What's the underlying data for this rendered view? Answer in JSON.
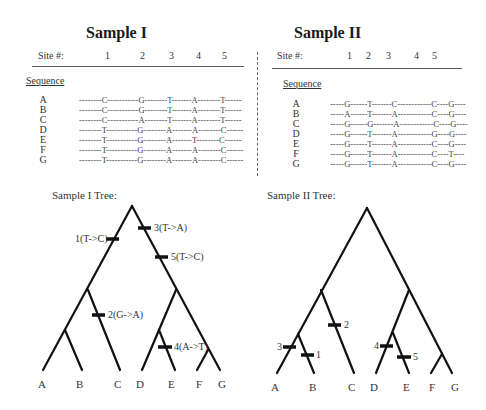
{
  "panels": [
    {
      "title": "Sample I",
      "site_label": "Site #:",
      "sites": [
        "1",
        "2",
        "3",
        "4",
        "5"
      ],
      "sequence_label": "Sequence",
      "rows": [
        {
          "taxon": "A",
          "bases": [
            "C",
            "G",
            "T",
            "A",
            "T"
          ],
          "display": "--------C-----------G--------T-------A--------T------"
        },
        {
          "taxon": "B",
          "bases": [
            "C",
            "G",
            "T",
            "A",
            "T"
          ],
          "display": "--------C-----------G--------T-------A--------T------"
        },
        {
          "taxon": "C",
          "bases": [
            "C",
            "A",
            "T",
            "A",
            "T"
          ],
          "display": "--------C-----------A--------T-------A--------T------"
        },
        {
          "taxon": "D",
          "bases": [
            "T",
            "G",
            "A",
            "A",
            "C"
          ],
          "display": "--------T-----------G--------A-------A--------C------"
        },
        {
          "taxon": "E",
          "bases": [
            "T",
            "G",
            "A",
            "T",
            "C"
          ],
          "display": "--------T-----------G--------A-------T--------C------"
        },
        {
          "taxon": "F",
          "bases": [
            "T",
            "G",
            "A",
            "A",
            "C"
          ],
          "display": "--------T-----------G--------A-------A--------C------"
        },
        {
          "taxon": "G",
          "bases": [
            "T",
            "G",
            "A",
            "A",
            "C"
          ],
          "display": "--------T-----------G--------A-------A--------C------"
        }
      ],
      "tree_title": "Sample I Tree:",
      "tree_leaves": [
        "A",
        "B",
        "C",
        "D",
        "E",
        "F",
        "G"
      ],
      "mutations": [
        {
          "label": "1(T->C)"
        },
        {
          "label": "2(G->A)"
        },
        {
          "label": "3(T->A)"
        },
        {
          "label": "4(A->T)"
        },
        {
          "label": "5(T->C)"
        }
      ]
    },
    {
      "title": "Sample II",
      "site_label": "Site #:",
      "sites": [
        "1",
        "2",
        "3",
        "4",
        "5"
      ],
      "sequence_label": "Sequence",
      "rows": [
        {
          "taxon": "A",
          "bases": [
            "G",
            "T",
            "C",
            "C",
            "G"
          ],
          "display": "-----G------T-------C------------C----G----"
        },
        {
          "taxon": "B",
          "bases": [
            "A",
            "T",
            "A",
            "C",
            "G"
          ],
          "display": "-----A------T-------A------------C----G----"
        },
        {
          "taxon": "C",
          "bases": [
            "G",
            "G",
            "A",
            "C",
            "G"
          ],
          "display": "-----G------G-------A------------C----G----"
        },
        {
          "taxon": "D",
          "bases": [
            "G",
            "T",
            "A",
            "G",
            "G"
          ],
          "display": "-----G------T-------A------------G----G----"
        },
        {
          "taxon": "E",
          "bases": [
            "G",
            "T",
            "A",
            "C",
            "G"
          ],
          "display": "-----G------T-------A------------C----G----"
        },
        {
          "taxon": "F",
          "bases": [
            "G",
            "T",
            "A",
            "C",
            "T"
          ],
          "display": "-----G------T-------A------------C----T----"
        },
        {
          "taxon": "G",
          "bases": [
            "G",
            "T",
            "A",
            "C",
            "G"
          ],
          "display": "-----G------T-------A------------C----G----"
        }
      ],
      "tree_title": "Sample II Tree:",
      "tree_leaves": [
        "A",
        "B",
        "C",
        "D",
        "E",
        "F",
        "G"
      ],
      "mutations": [
        {
          "label": "1"
        },
        {
          "label": "2"
        },
        {
          "label": "3"
        },
        {
          "label": "4"
        },
        {
          "label": "5"
        }
      ]
    }
  ]
}
